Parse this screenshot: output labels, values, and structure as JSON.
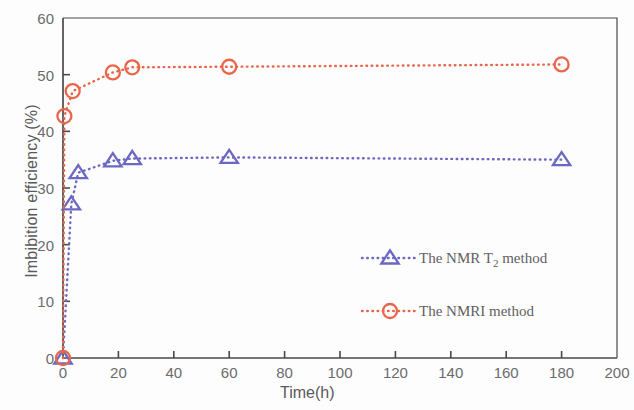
{
  "chart_data": {
    "type": "line",
    "title": "",
    "xlabel": "Time(h)",
    "ylabel": "Imbibition efficiency (%)",
    "xlim": [
      0,
      200
    ],
    "ylim": [
      0,
      60
    ],
    "xticks": [
      0,
      20,
      40,
      60,
      80,
      100,
      120,
      140,
      160,
      180,
      200
    ],
    "yticks": [
      0,
      10,
      20,
      30,
      40,
      50,
      60
    ],
    "xtick_labels": [
      "0",
      "20",
      "40",
      "60",
      "80",
      "100",
      "120",
      "140",
      "160",
      "180",
      "200"
    ],
    "ytick_labels": [
      "0",
      "10",
      "20",
      "30",
      "40",
      "50",
      "60"
    ],
    "grid": false,
    "legend_position": "center-right-inside",
    "series": [
      {
        "name": "The NMR T2 method",
        "label_main": "The NMR T",
        "label_sub": "2",
        "label_tail": " method",
        "color": "#6b68c4",
        "marker": "triangle",
        "linestyle": "dotted",
        "x": [
          0,
          3,
          5.5,
          18,
          25,
          60,
          180
        ],
        "y": [
          0,
          27.2,
          32.7,
          34.8,
          35.2,
          35.4,
          35.0
        ]
      },
      {
        "name": "The NMRI method",
        "label_main": "The NMRI method",
        "label_sub": "",
        "label_tail": "",
        "color": "#e8674b",
        "marker": "circle",
        "linestyle": "dotted",
        "x": [
          0,
          0.5,
          3.5,
          18,
          25,
          60,
          180
        ],
        "y": [
          0,
          42.7,
          47.1,
          50.4,
          51.3,
          51.4,
          51.8
        ]
      }
    ]
  },
  "legend": {
    "entries": [
      {
        "text_main": "The NMR T",
        "text_sub": "2",
        "text_tail": " method",
        "color": "#6b68c4",
        "marker": "triangle"
      },
      {
        "text_main": "The NMRI method",
        "text_sub": "",
        "text_tail": "",
        "color": "#e8674b",
        "marker": "circle"
      }
    ]
  },
  "axes": {
    "frame_color": "#4a4a4c"
  }
}
